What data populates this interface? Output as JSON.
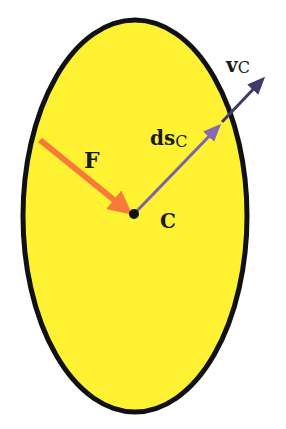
{
  "diagram": {
    "body": {
      "shape": "ellipse",
      "fill": "#FFF233",
      "stroke": "#111111"
    },
    "point": {
      "label": "C",
      "color": "#111111"
    },
    "force": {
      "label": "F",
      "color": "#F77A3A"
    },
    "displacement": {
      "label_main": "ds",
      "label_sub": "C",
      "color": "#7A63A8"
    },
    "velocity": {
      "label_main": "v",
      "label_sub": "C",
      "color": "#3F3A6B"
    }
  }
}
